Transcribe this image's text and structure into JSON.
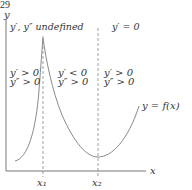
{
  "page_number": "29",
  "diagram": {
    "y_axis_label": "y",
    "x_axis_label": "x",
    "curve_label": "y = f(x)",
    "tick_labels": [
      "x₁",
      "x₂"
    ],
    "top_annotations": {
      "x1": "y′, y″ undefined",
      "x2": "y′ = 0"
    },
    "regions": [
      {
        "name": "left",
        "line1": "y′ > 0",
        "line2": "y″ > 0"
      },
      {
        "name": "middle",
        "line1": "y′ < 0",
        "line2": "y″ > 0"
      },
      {
        "name": "right",
        "line1": "y′ > 0",
        "line2": "y″ > 0"
      }
    ],
    "colors": {
      "curve": "#8a8a8a",
      "axis": "#777777",
      "text": "#333333"
    }
  }
}
